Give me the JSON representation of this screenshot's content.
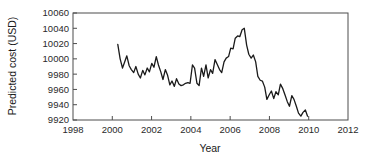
{
  "chart_data": {
    "type": "line",
    "title": "",
    "xlabel": "Year",
    "ylabel": "Predicted cost (USD)",
    "xlim": [
      1998,
      2012
    ],
    "ylim": [
      9920,
      10060
    ],
    "xticks": [
      1998,
      2000,
      2002,
      2004,
      2006,
      2008,
      2010,
      2012
    ],
    "yticks": [
      9920,
      9940,
      9960,
      9980,
      10000,
      10020,
      10040,
      10060
    ],
    "grid": false,
    "legend": null,
    "line_color": "#1a1a1a",
    "series": [
      {
        "name": "Predicted cost",
        "x": [
          2000.28,
          2000.4,
          2000.52,
          2000.63,
          2000.74,
          2000.86,
          2000.97,
          2001.09,
          2001.2,
          2001.32,
          2001.43,
          2001.55,
          2001.66,
          2001.78,
          2001.89,
          2002.01,
          2002.12,
          2002.24,
          2002.35,
          2002.47,
          2002.58,
          2002.7,
          2002.81,
          2002.93,
          2003.04,
          2003.16,
          2003.27,
          2003.39,
          2003.5,
          2003.62,
          2003.73,
          2003.85,
          2003.96,
          2004.08,
          2004.19,
          2004.31,
          2004.42,
          2004.54,
          2004.65,
          2004.77,
          2004.88,
          2005.0,
          2005.11,
          2005.23,
          2005.34,
          2005.46,
          2005.57,
          2005.69,
          2005.8,
          2005.92,
          2006.03,
          2006.15,
          2006.26,
          2006.38,
          2006.49,
          2006.61,
          2006.72,
          2006.84,
          2006.95,
          2007.07,
          2007.18,
          2007.3,
          2007.41,
          2007.53,
          2007.64,
          2007.76,
          2007.87,
          2007.99,
          2008.1,
          2008.22,
          2008.33,
          2008.45,
          2008.56,
          2008.68,
          2008.79,
          2008.91,
          2009.02,
          2009.14,
          2009.25,
          2009.37,
          2009.48,
          2009.6,
          2009.71,
          2009.83,
          2009.94
        ],
        "y": [
          10019,
          10000,
          9988,
          9996,
          10004,
          9991,
          9986,
          9982,
          9990,
          9980,
          9975,
          9985,
          9979,
          9988,
          9983,
          9994,
          9989,
          10003,
          9992,
          9983,
          9973,
          9986,
          9979,
          9966,
          9971,
          9964,
          9974,
          9967,
          9965,
          9966,
          9968,
          9969,
          9968,
          9992,
          9988,
          9968,
          9965,
          9988,
          9977,
          9992,
          9975,
          9986,
          9981,
          9999,
          9993,
          9986,
          9982,
          9996,
          10001,
          10003,
          10014,
          10013,
          10027,
          10030,
          10029,
          10038,
          10040,
          10018,
          10006,
          10001,
          10005,
          9996,
          9977,
          9972,
          9971,
          9963,
          9947,
          9953,
          9958,
          9948,
          9957,
          9953,
          9967,
          9961,
          9953,
          9944,
          9938,
          9952,
          9947,
          9938,
          9929,
          9925,
          9930,
          9933,
          9925
        ]
      }
    ]
  },
  "axis": {
    "y_tick_labels": [
      "10060",
      "10040",
      "10020",
      "10000",
      "9980",
      "9960",
      "9940",
      "9920"
    ],
    "x_tick_labels": [
      "1998",
      "2000",
      "2002",
      "2004",
      "2006",
      "2008",
      "2010",
      "2012"
    ],
    "y_axis_title": "Predicted cost (USD)",
    "x_axis_title": "Year"
  }
}
